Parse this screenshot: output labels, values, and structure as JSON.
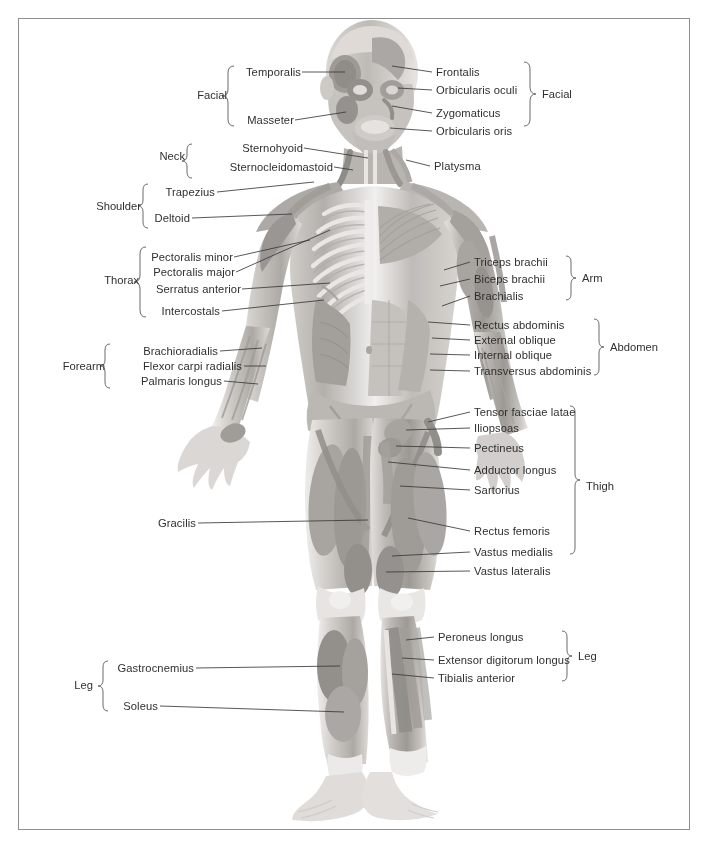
{
  "figure": {
    "orientation": "anterior"
  },
  "groups": {
    "facial_left": "Facial",
    "facial_right": "Facial",
    "neck": "Neck",
    "shoulder": "Shoulder",
    "thorax": "Thorax",
    "forearm": "Forearm",
    "arm": "Arm",
    "abdomen": "Abdomen",
    "thigh": "Thigh",
    "leg_left": "Leg",
    "leg_right": "Leg"
  },
  "labels_left": [
    {
      "id": "temporalis",
      "text": "Temporalis",
      "group": "Facial"
    },
    {
      "id": "masseter",
      "text": "Masseter",
      "group": "Facial"
    },
    {
      "id": "sternohyoid",
      "text": "Sternohyoid",
      "group": "Neck"
    },
    {
      "id": "sternocleidomastoid",
      "text": "Sternocleidomastoid",
      "group": "Neck"
    },
    {
      "id": "trapezius",
      "text": "Trapezius",
      "group": "Shoulder"
    },
    {
      "id": "deltoid",
      "text": "Deltoid",
      "group": "Shoulder"
    },
    {
      "id": "pectoralis-minor",
      "text": "Pectoralis minor",
      "group": "Thorax"
    },
    {
      "id": "pectoralis-major",
      "text": "Pectoralis major",
      "group": "Thorax"
    },
    {
      "id": "serratus-anterior",
      "text": "Serratus anterior",
      "group": "Thorax"
    },
    {
      "id": "intercostals",
      "text": "Intercostals",
      "group": "Thorax"
    },
    {
      "id": "brachioradialis",
      "text": "Brachioradialis",
      "group": "Forearm"
    },
    {
      "id": "flexor-carpi-radialis",
      "text": "Flexor carpi radialis",
      "group": "Forearm"
    },
    {
      "id": "palmaris-longus",
      "text": "Palmaris longus",
      "group": "Forearm"
    },
    {
      "id": "gracilis",
      "text": "Gracilis",
      "group": ""
    },
    {
      "id": "gastrocnemius",
      "text": "Gastrocnemius",
      "group": "Leg"
    },
    {
      "id": "soleus",
      "text": "Soleus",
      "group": "Leg"
    }
  ],
  "labels_right": [
    {
      "id": "frontalis",
      "text": "Frontalis",
      "group": "Facial"
    },
    {
      "id": "orbicularis-oculi",
      "text": "Orbicularis oculi",
      "group": "Facial"
    },
    {
      "id": "zygomaticus",
      "text": "Zygomaticus",
      "group": "Facial"
    },
    {
      "id": "orbicularis-oris",
      "text": "Orbicularis oris",
      "group": "Facial"
    },
    {
      "id": "platysma",
      "text": "Platysma",
      "group": ""
    },
    {
      "id": "triceps-brachii",
      "text": "Triceps brachii",
      "group": "Arm"
    },
    {
      "id": "biceps-brachii",
      "text": "Biceps brachii",
      "group": "Arm"
    },
    {
      "id": "brachialis",
      "text": "Brachialis",
      "group": "Arm"
    },
    {
      "id": "rectus-abdominis",
      "text": "Rectus abdominis",
      "group": "Abdomen"
    },
    {
      "id": "external-oblique",
      "text": "External oblique",
      "group": "Abdomen"
    },
    {
      "id": "internal-oblique",
      "text": "Internal oblique",
      "group": "Abdomen"
    },
    {
      "id": "transversus-abdominis",
      "text": "Transversus abdominis",
      "group": "Abdomen"
    },
    {
      "id": "tensor-fasciae-latae",
      "text": "Tensor fasciae latae",
      "group": "Thigh"
    },
    {
      "id": "iliopsoas",
      "text": "Iliopsoas",
      "group": "Thigh"
    },
    {
      "id": "pectineus",
      "text": "Pectineus",
      "group": "Thigh"
    },
    {
      "id": "adductor-longus",
      "text": "Adductor longus",
      "group": "Thigh"
    },
    {
      "id": "sartorius",
      "text": "Sartorius",
      "group": "Thigh"
    },
    {
      "id": "rectus-femoris",
      "text": "Rectus femoris",
      "group": "Thigh"
    },
    {
      "id": "vastus-medialis",
      "text": "Vastus medialis",
      "group": "Thigh"
    },
    {
      "id": "vastus-lateralis",
      "text": "Vastus lateralis",
      "group": "Thigh"
    },
    {
      "id": "peroneus-longus",
      "text": "Peroneus longus",
      "group": "Leg"
    },
    {
      "id": "extensor-digitorum-longus",
      "text": "Extensor digitorum longus",
      "group": "Leg"
    },
    {
      "id": "tibialis-anterior",
      "text": "Tibialis anterior",
      "group": "Leg"
    }
  ],
  "colors": {
    "frame": "#8e8e90",
    "text": "#2f2f2f",
    "leader": "#3a3a3a",
    "background": "#ffffff",
    "muscle_dark": "#8d8a88",
    "muscle_mid": "#b3afac",
    "muscle_light": "#d8d5d2",
    "bone": "#ece9e6"
  }
}
